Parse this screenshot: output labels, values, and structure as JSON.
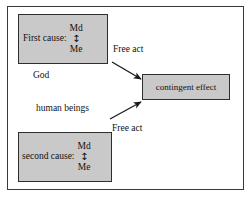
{
  "diagram": {
    "title_text": "",
    "colors": {
      "box_fill": "#c9c9c9",
      "box_border": "#2e2e2e",
      "frame_border": "#3a3a3a",
      "background": "#ffffff",
      "text": "#111111",
      "arrow": "#1a1a1a"
    },
    "boxes": {
      "first_cause": {
        "label": "First cause:",
        "modal_top": "Md",
        "modal_arrow": "↕",
        "modal_bottom": "Me"
      },
      "second_cause": {
        "label": "second cause:",
        "modal_top": "Md",
        "modal_arrow": "↕",
        "modal_bottom": "Me"
      },
      "contingent_effect": {
        "label": "contingent effect"
      }
    },
    "labels": {
      "god": "God",
      "human_beings": "human beings",
      "free_act_top": "Free act",
      "free_act_bottom": "Free act"
    },
    "arrows": [
      {
        "name": "first-cause-to-effect",
        "from": "first_cause",
        "to": "contingent_effect",
        "label": "Free act"
      },
      {
        "name": "second-cause-to-effect",
        "from": "second_cause",
        "to": "contingent_effect",
        "label": "Free act"
      }
    ]
  }
}
